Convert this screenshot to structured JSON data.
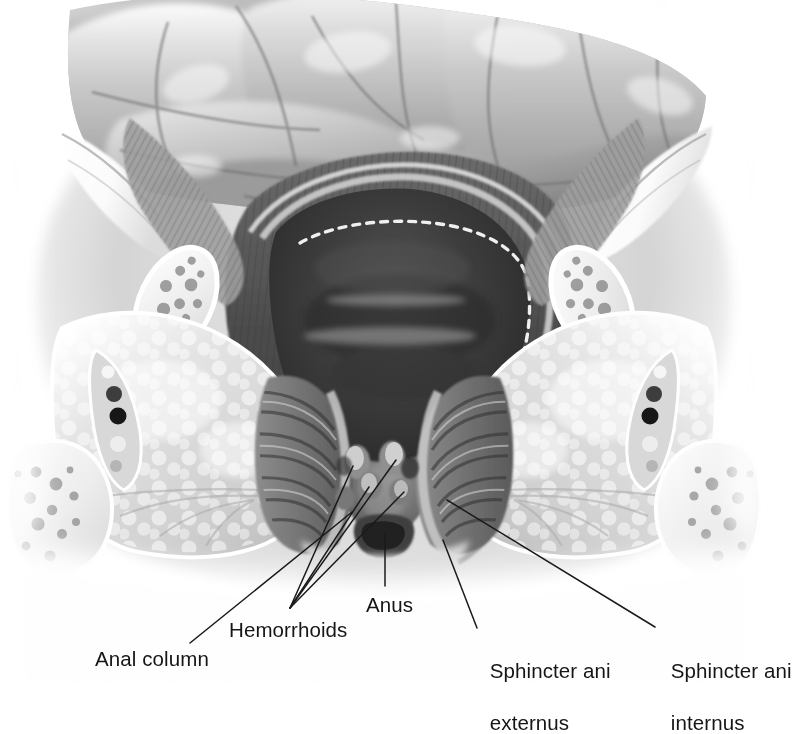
{
  "illustration": {
    "title": "Anal canal with hemorrhoids — coronal section",
    "style": "grayscale medical airbrush illustration",
    "background_color": "#ffffff",
    "label_text_color": "#161616",
    "leader_line_color": "#1a1a1a"
  },
  "labels": [
    {
      "id": "anal-column",
      "text": "Anal column",
      "lines": [
        "Anal column"
      ],
      "x": 95,
      "y": 646,
      "leader": {
        "from": [
          190,
          643
        ],
        "to": [
          352,
          512
        ]
      }
    },
    {
      "id": "hemorrhoids",
      "text": "Hemorrhoids",
      "lines": [
        "Hemorrhoids"
      ],
      "x": 229,
      "y": 617,
      "leader_count": 4
    },
    {
      "id": "anus",
      "text": "Anus",
      "lines": [
        "Anus"
      ],
      "x": 366,
      "y": 592,
      "leader": {
        "from": [
          385,
          586
        ],
        "to": [
          385,
          533
        ]
      }
    },
    {
      "id": "sphincter-ani-externus",
      "text": "Sphincter ani externus",
      "lines": [
        "Sphincter ani",
        "externus"
      ],
      "x": 455,
      "y": 632,
      "leader": {
        "from": [
          477,
          628
        ],
        "to": [
          443,
          540
        ]
      }
    },
    {
      "id": "sphincter-ani-internus",
      "text": "Sphincter ani internus",
      "lines": [
        "Sphincter ani",
        "internus"
      ],
      "x": 636,
      "y": 632,
      "leader": {
        "from": [
          655,
          627
        ],
        "to": [
          447,
          500
        ]
      }
    }
  ],
  "structures": [
    {
      "name": "rectal-ampulla-folds",
      "region": "top"
    },
    {
      "name": "rectal-lumen",
      "region": "center"
    },
    {
      "name": "pectinate-line",
      "region": "center",
      "style": "white dashed"
    },
    {
      "name": "levator-ani-cut-edge-left",
      "region": "upper-left"
    },
    {
      "name": "levator-ani-cut-edge-right",
      "region": "upper-right"
    },
    {
      "name": "ischial-bone-left",
      "region": "left"
    },
    {
      "name": "ischial-bone-right",
      "region": "right"
    },
    {
      "name": "ischiorectal-fossa-fat-left",
      "region": "left"
    },
    {
      "name": "ischiorectal-fossa-fat-right",
      "region": "right"
    },
    {
      "name": "pudendal-vessels-left",
      "region": "left"
    },
    {
      "name": "pudendal-vessels-right",
      "region": "right"
    },
    {
      "name": "hemorrhoid-nodules",
      "region": "center-lower"
    },
    {
      "name": "sphincter-externus-muscle",
      "region": "center-lower"
    },
    {
      "name": "sphincter-internus-muscle",
      "region": "center-lower"
    },
    {
      "name": "anal-opening",
      "region": "center-bottom"
    }
  ]
}
